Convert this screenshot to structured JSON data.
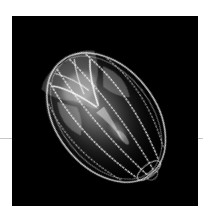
{
  "image": {
    "subject": "comb jelly (ctenophore) on black background",
    "alt": "Translucent comb jelly glowing white against a black background",
    "colors": {
      "page_background": "#ffffff",
      "photo_background": "#000000",
      "rule": "#c8c8c8",
      "highlight": "#ffffff"
    }
  }
}
